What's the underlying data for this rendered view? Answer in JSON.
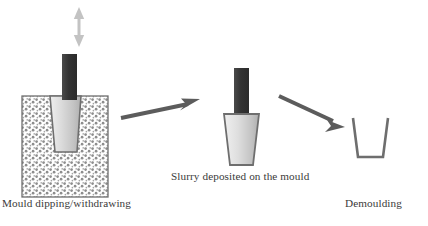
{
  "figure": {
    "width": 428,
    "height": 226,
    "background": "#ffffff"
  },
  "captions": {
    "stage1": "Mould dipping/withdrawing",
    "stage2": "Slurry deposited on the mould",
    "stage3": "Demoulding"
  },
  "colors": {
    "rod": "#3d3d3d",
    "mould_fill_light": "#e6e6e6",
    "mould_fill_dark": "#b8b8b8",
    "mould_outline": "#6e6e6e",
    "slurry_speckle": "#8a8a8a",
    "slurry_border": "#707070",
    "arrow": "#5c5c5c",
    "updown_arrow": "#c0c0c0",
    "text": "#3a3a3a"
  },
  "stages": [
    {
      "id": "stage-1",
      "name": "mould-dipping-withdrawing",
      "label": "Mould dipping/withdrawing",
      "elements": [
        "up-down-arrow",
        "holder-rod",
        "mould-trapezoid",
        "slurry-bath-container"
      ]
    },
    {
      "id": "stage-2",
      "name": "slurry-deposited-on-mould",
      "label": "Slurry deposited on the mould",
      "elements": [
        "holder-rod",
        "coated-mould-trapezoid"
      ]
    },
    {
      "id": "stage-3",
      "name": "demoulding",
      "label": "Demoulding",
      "elements": [
        "hollow-cup-outline"
      ]
    }
  ],
  "arrows": [
    {
      "name": "process-arrow-1",
      "from": "stage-1",
      "to": "stage-2",
      "direction": "right-up"
    },
    {
      "name": "process-arrow-2",
      "from": "stage-2",
      "to": "stage-3",
      "direction": "right-down"
    },
    {
      "name": "vertical-motion-arrow",
      "scope": "stage-1",
      "direction": "up-down"
    }
  ]
}
